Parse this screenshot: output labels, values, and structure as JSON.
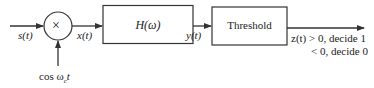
{
  "diagram": {
    "type": "block-diagram",
    "input_signal": "s(t)",
    "mixer_symbol": "×",
    "oscillator_label": "cos ω",
    "oscillator_sub": "c",
    "oscillator_tail": "t",
    "mixer_output": "x(t)",
    "filter_label": "H(ω)",
    "filter_output": "y(t)",
    "threshold_label": "Threshold",
    "decision_line1": "z(t) > 0, decide 1",
    "decision_line2": "< 0, decide 0",
    "colors": {
      "stroke": "#333333",
      "text": "#222222",
      "background": "#ffffff"
    }
  }
}
